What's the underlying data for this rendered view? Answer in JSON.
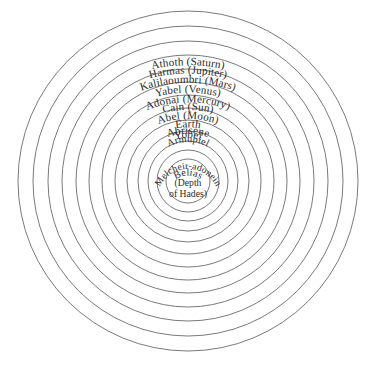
{
  "figure": {
    "name": "concentric-spheres-diagram",
    "background_color": "#ffffff",
    "stroke_color": "#6b6b6b",
    "text_color": "#2b2b2b",
    "center": {
      "x": 188,
      "y": 181
    },
    "circle_count": 13
  },
  "rings": [
    {
      "index": 1,
      "label": "Athoth (Saturn)",
      "archon": "Athoth",
      "planet": "Saturn",
      "radius": 170
    },
    {
      "index": 2,
      "label": "Harmas (Jupiter)",
      "archon": "Harmas",
      "planet": "Jupiter",
      "radius": 155
    },
    {
      "index": 3,
      "label": "Kalilaoumbri (Mars)",
      "archon": "Kalilaoumbri",
      "planet": "Mars",
      "radius": 140
    },
    {
      "index": 4,
      "label": "Yabel (Venus)",
      "archon": "Yabel",
      "planet": "Venus",
      "radius": 126
    },
    {
      "index": 5,
      "label": "Adonai (Mercury)",
      "archon": "Adonai",
      "planet": "Mercury",
      "radius": 112
    },
    {
      "index": 6,
      "label": "Cain (Sun)",
      "archon": "Cain",
      "planet": "Sun",
      "radius": 99
    },
    {
      "index": 7,
      "label": "Abel (Moon)",
      "archon": "Abel",
      "planet": "Moon",
      "radius": 86
    },
    {
      "index": 8,
      "label": "Earth",
      "archon": "Earth",
      "planet": "",
      "radius": 73
    },
    {
      "index": 9,
      "label": "Abrisene",
      "archon": "Abrisene",
      "planet": "",
      "radius": 61
    },
    {
      "index": 10,
      "label": "Yobel",
      "archon": "Yobel",
      "planet": "",
      "radius": 50
    },
    {
      "index": 11,
      "label": "Armupiel",
      "archon": "Armupiel",
      "planet": "",
      "radius": 40
    },
    {
      "index": 12,
      "label": "Melcheir-adonein",
      "archon": "Melcheir-adonein",
      "planet": "",
      "radius": 31
    },
    {
      "index": 13,
      "label": "Belias",
      "archon": "Belias",
      "planet": "",
      "radius": 22
    }
  ],
  "core": {
    "name": "Belias",
    "subtitle_line1": "(Depth",
    "subtitle_line2": "of Hades)"
  }
}
